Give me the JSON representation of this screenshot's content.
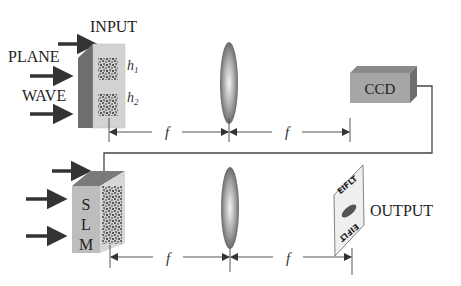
{
  "labels": {
    "input": "INPUT",
    "plane": "PLANE",
    "wave": "WAVE",
    "h1": "h",
    "h1_sub": "1",
    "h2": "h",
    "h2_sub": "2",
    "ccd": "CCD",
    "slm_s": "S",
    "slm_l": "L",
    "slm_m": "M",
    "output": "OUTPUT",
    "focal": "f",
    "output_pattern_top": "EIFLT",
    "output_pattern_bottom": "EIFLT"
  },
  "colors": {
    "box_front": "#c9c9c9",
    "box_side": "#6e6e6e",
    "box_top": "#8a8a8a",
    "ccd_front": "#a6a6a6",
    "lens": "#9a9a9a",
    "line": "#555555",
    "arrow": "#333333"
  }
}
